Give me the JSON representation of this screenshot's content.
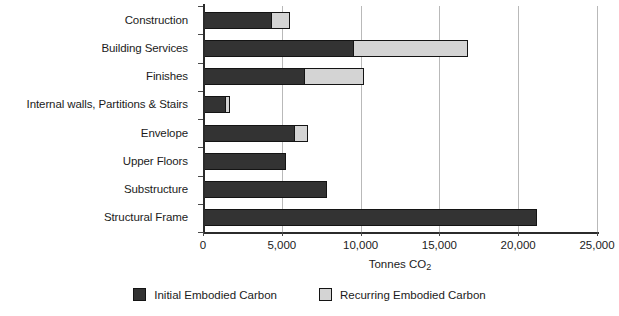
{
  "chart_data": {
    "type": "bar",
    "orientation": "horizontal",
    "stacked": true,
    "title": "",
    "xlabel": "Tonnes CO2",
    "xlabel_base": "Tonnes CO",
    "xlabel_sub": "2",
    "ylabel": "",
    "xlim": [
      0,
      25000
    ],
    "xticks": [
      0,
      5000,
      10000,
      15000,
      20000,
      25000
    ],
    "xtick_labels": [
      "0",
      "5,000",
      "10,000",
      "15,000",
      "20,000",
      "25,000"
    ],
    "grid": "vertical",
    "legend_position": "bottom-center",
    "categories": [
      "Construction",
      "Building Services",
      "Finishes",
      "Internal walls, Partitions & Stairs",
      "Envelope",
      "Upper Floors",
      "Substructure",
      "Structural Frame"
    ],
    "series": [
      {
        "name": "Initial Embodied Carbon",
        "color": "#333333",
        "values": [
          4400,
          9600,
          6500,
          1450,
          5850,
          5250,
          7850,
          21200
        ]
      },
      {
        "name": "Recurring Embodied Carbon",
        "color": "#d4d4d4",
        "values": [
          1200,
          7300,
          3800,
          330,
          900,
          0,
          0,
          0
        ]
      }
    ],
    "totals": [
      5600,
      16900,
      10300,
      1780,
      6750,
      5250,
      7850,
      21200
    ]
  },
  "legend": {
    "items": [
      {
        "label": "Initial Embodied Carbon",
        "swatch": "initial"
      },
      {
        "label": "Recurring Embodied Carbon",
        "swatch": "recurring"
      }
    ]
  },
  "colors": {
    "initial": "#333333",
    "recurring": "#d4d4d4",
    "axis": "#2b2b2b",
    "grid": "#b9b9b9",
    "text": "#1b1b1b",
    "background": "#ffffff"
  }
}
